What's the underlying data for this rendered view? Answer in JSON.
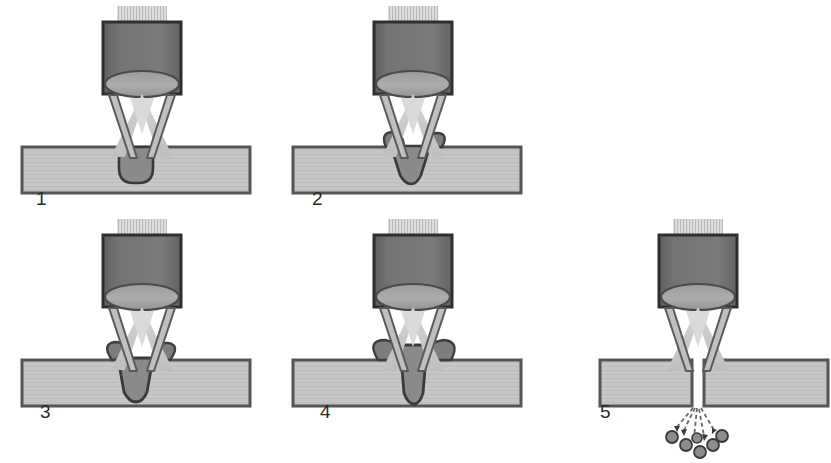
{
  "figure": {
    "stage_count": 5,
    "canvas": {
      "width": 831,
      "height": 463,
      "background": "#ffffff"
    }
  },
  "colors": {
    "head_body": "#6f6f6f",
    "head_outline": "#2f2f2f",
    "lens_fill": "#a3a3a3",
    "lens_outline": "#4a4a4a",
    "beam_entry_hatch": "#cfcfcf",
    "beam_cone": "#cacaca",
    "nozzle_fill": "#bdbdbd",
    "nozzle_outline": "#5a5a5a",
    "workpiece_fill": "#c3c3c3",
    "workpiece_outline": "#555555",
    "melt_fill": "#7d7d7d",
    "melt_outline": "#3d3d3d",
    "cavity_fill": "#8a8a8a",
    "cavity_outline": "#3a3a3a",
    "droplet_fill": "#8d8d8d",
    "droplet_outline": "#3a3a3a",
    "trajectory": "#6a6a6a",
    "label_text": "#2b2b2b"
  },
  "stages": [
    {
      "id": "stage-1",
      "label": "1",
      "label_x": 36,
      "label_y": 205,
      "caption": "Beam strikes surface, shallow rounded melt pit forms",
      "penetration": "shallow-pit",
      "workpiece": {
        "x": 22,
        "y": 147,
        "width": 228,
        "height": 46,
        "split": false
      },
      "head": {
        "x": 103,
        "y": 22,
        "width": 78,
        "height": 72
      },
      "cavity_depth": 26,
      "has_melt_ridge": false,
      "has_droplets": false
    },
    {
      "id": "stage-2",
      "label": "2",
      "label_x": 312,
      "label_y": 205,
      "caption": "Cavity deepens into a V keyhole, melt ridges build at rim",
      "penetration": "v-keyhole",
      "workpiece": {
        "x": 293,
        "y": 147,
        "width": 228,
        "height": 46,
        "split": false
      },
      "head": {
        "x": 374,
        "y": 22,
        "width": 78,
        "height": 72
      },
      "cavity_depth": 36,
      "has_melt_ridge": true,
      "has_droplets": false
    },
    {
      "id": "stage-3",
      "label": "3",
      "label_x": 40,
      "label_y": 418,
      "caption": "Keyhole narrows and drives deeper, melt ejected upward",
      "penetration": "deep-keyhole",
      "workpiece": {
        "x": 22,
        "y": 360,
        "width": 228,
        "height": 46,
        "split": false
      },
      "head": {
        "x": 103,
        "y": 235,
        "width": 78,
        "height": 72
      },
      "cavity_depth": 42,
      "has_melt_ridge": true,
      "has_droplets": false
    },
    {
      "id": "stage-4",
      "label": "4",
      "label_x": 320,
      "label_y": 418,
      "caption": "Near full penetration, broad melt pool spreads on top surface",
      "penetration": "full-penetration",
      "workpiece": {
        "x": 293,
        "y": 360,
        "width": 228,
        "height": 46,
        "split": false
      },
      "head": {
        "x": 374,
        "y": 235,
        "width": 78,
        "height": 72
      },
      "cavity_depth": 46,
      "has_melt_ridge": true,
      "has_droplets": false
    },
    {
      "id": "stage-5",
      "label": "5",
      "label_x": 600,
      "label_y": 418,
      "caption": "Material fully separated, molten droplets expelled below the kerf",
      "penetration": "separated",
      "workpiece": {
        "x": 600,
        "y": 360,
        "width": 228,
        "height": 46,
        "split": true,
        "kerf_gap": 12
      },
      "head": {
        "x": 659,
        "y": 235,
        "width": 78,
        "height": 72
      },
      "cavity_depth": 46,
      "has_melt_ridge": false,
      "has_droplets": true,
      "droplet_count": 6,
      "trajectory_count": 5
    }
  ]
}
